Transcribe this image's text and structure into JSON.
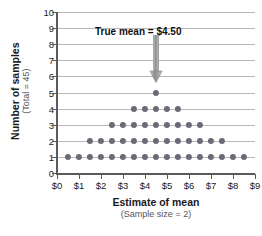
{
  "chart_data": {
    "type": "scatter",
    "plot_style": "dot-plot",
    "title": "",
    "xlabel": "Estimate of mean",
    "xlabel_sub": "(Sample size = 2)",
    "ylabel": "Number of samples",
    "ylabel_sub": "(Total = 45)",
    "xlim": [
      0,
      9
    ],
    "ylim": [
      0,
      10
    ],
    "grid": true,
    "grid_axis": "y",
    "legend": false,
    "xticks": [
      0,
      1,
      2,
      3,
      4,
      5,
      6,
      7,
      8,
      9
    ],
    "xtick_labels": [
      "$0",
      "$1",
      "$2",
      "$3",
      "$4",
      "$5",
      "$6",
      "$7",
      "$8",
      "$9"
    ],
    "yticks": [
      0,
      1,
      2,
      3,
      4,
      5,
      6,
      7,
      8,
      9,
      10
    ],
    "ytick_labels": [
      "0",
      "1",
      "2",
      "3",
      "4",
      "5",
      "6",
      "7",
      "8",
      "9",
      "10"
    ],
    "dot_color": "#6b6b78",
    "grid_color": "#b8b8b8",
    "axis_color": "#5a5a5a",
    "total_samples": 45,
    "stacks": [
      {
        "x": 0.5,
        "count": 1
      },
      {
        "x": 1.0,
        "count": 1
      },
      {
        "x": 1.5,
        "count": 2
      },
      {
        "x": 2.0,
        "count": 2
      },
      {
        "x": 2.5,
        "count": 3
      },
      {
        "x": 3.0,
        "count": 3
      },
      {
        "x": 3.5,
        "count": 4
      },
      {
        "x": 4.0,
        "count": 4
      },
      {
        "x": 4.5,
        "count": 5
      },
      {
        "x": 5.0,
        "count": 4
      },
      {
        "x": 5.5,
        "count": 4
      },
      {
        "x": 6.0,
        "count": 3
      },
      {
        "x": 6.5,
        "count": 3
      },
      {
        "x": 7.0,
        "count": 2
      },
      {
        "x": 7.5,
        "count": 2
      },
      {
        "x": 8.0,
        "count": 1
      },
      {
        "x": 8.5,
        "count": 1
      }
    ],
    "rows": [
      {
        "y": 1,
        "count": 17,
        "x_values": [
          0.5,
          1.0,
          1.5,
          2.0,
          2.5,
          3.0,
          3.5,
          4.0,
          4.5,
          5.0,
          5.5,
          6.0,
          6.5,
          7.0,
          7.5,
          8.0,
          8.5
        ]
      },
      {
        "y": 2,
        "count": 13,
        "x_values": [
          1.5,
          2.0,
          2.5,
          3.0,
          3.5,
          4.0,
          4.5,
          5.0,
          5.5,
          6.0,
          6.5,
          7.0,
          7.5
        ]
      },
      {
        "y": 3,
        "count": 9,
        "x_values": [
          2.5,
          3.0,
          3.5,
          4.0,
          4.5,
          5.0,
          5.5,
          6.0,
          6.5
        ]
      },
      {
        "y": 4,
        "count": 5,
        "x_values": [
          3.5,
          4.0,
          4.5,
          5.0,
          5.5
        ]
      },
      {
        "y": 5,
        "count": 1,
        "x_values": [
          4.5
        ]
      }
    ],
    "annotations": [
      {
        "text": "True mean  =  $4.50",
        "x": 4.5,
        "arrow": true,
        "arrow_color": "#8c8c8c",
        "arrow_from_y": 8.6,
        "arrow_to_y": 5.6
      }
    ]
  }
}
